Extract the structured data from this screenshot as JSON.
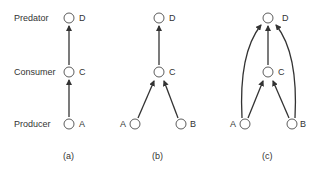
{
  "levels": {
    "predator": "Predator",
    "consumer": "Consumer",
    "producer": "Producer"
  },
  "panels": [
    {
      "caption": "(a)",
      "nodes": {
        "D": "D",
        "C": "C",
        "A": "A"
      },
      "edges": [
        [
          "A",
          "C"
        ],
        [
          "C",
          "D"
        ]
      ]
    },
    {
      "caption": "(b)",
      "nodes": {
        "D": "D",
        "C": "C",
        "A": "A",
        "B": "B"
      },
      "edges": [
        [
          "A",
          "C"
        ],
        [
          "B",
          "C"
        ],
        [
          "C",
          "D"
        ]
      ]
    },
    {
      "caption": "(c)",
      "nodes": {
        "D": "D",
        "C": "C",
        "A": "A",
        "B": "B"
      },
      "edges": [
        [
          "A",
          "C"
        ],
        [
          "B",
          "C"
        ],
        [
          "C",
          "D"
        ],
        [
          "A",
          "D"
        ],
        [
          "B",
          "D"
        ]
      ]
    }
  ],
  "colors": {
    "stroke": "#333333",
    "text": "#333333",
    "background": "#ffffff"
  }
}
